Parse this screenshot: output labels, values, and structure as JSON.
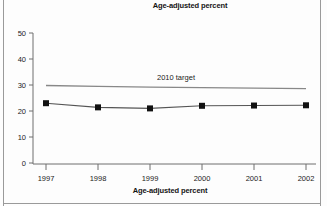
{
  "chart_data": {
    "type": "line",
    "title": "Age-adjusted percent",
    "xlabel": "Age-adjusted percent",
    "ylabel": "",
    "categories": [
      "1997",
      "1998",
      "1999",
      "2000",
      "2001",
      "2002"
    ],
    "x": [
      1997,
      1998,
      1999,
      2000,
      2001,
      2002
    ],
    "series": [
      {
        "name": "Age-adjusted percent",
        "values": [
          23.0,
          21.4,
          21.0,
          22.0,
          22.1,
          22.2
        ],
        "marker": "square",
        "marker_color": "#111111",
        "line_color": "#555555"
      },
      {
        "name": "2010 target",
        "values": [
          29.8,
          29.5,
          29.2,
          29.0,
          28.8,
          28.6
        ],
        "marker": "none",
        "line_color": "#888888"
      }
    ],
    "annotations": [
      {
        "text": "2010 target",
        "x": 1999.5,
        "y": 31.5
      }
    ],
    "ylim": [
      0,
      50
    ],
    "yticks": [
      0,
      10,
      20,
      30,
      40,
      50
    ],
    "ytick_labels": [
      "0",
      "10",
      "20",
      "30",
      "40",
      "50"
    ],
    "xticks": [
      1997,
      1998,
      1999,
      2000,
      2001,
      2002
    ],
    "grid": false,
    "legend": "none"
  },
  "colors": {
    "marker": "#111111",
    "data_line": "#555555",
    "target_line": "#8d8d8d",
    "axis": "#6e6e6e",
    "frame": "#9a9a9a",
    "text": "#141414"
  },
  "axis": {
    "y_tick_0": "0",
    "y_tick_1": "10",
    "y_tick_2": "20",
    "y_tick_3": "30",
    "y_tick_4": "40",
    "y_tick_5": "50",
    "x_tick_0": "1997",
    "x_tick_1": "1998",
    "x_tick_2": "1999",
    "x_tick_3": "2000",
    "x_tick_4": "2001",
    "x_tick_5": "2002"
  },
  "labels": {
    "top_title": "Age-adjusted percent",
    "bottom_title": "Age-adjusted percent",
    "target_annotation": "2010 target"
  }
}
